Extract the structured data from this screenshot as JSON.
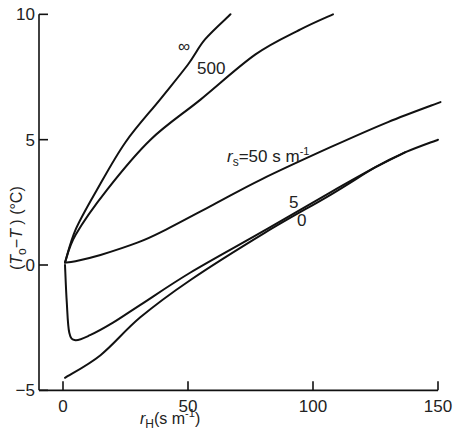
{
  "chart_data": {
    "type": "line",
    "title": "",
    "xlabel": "r_H (s m^-1)",
    "ylabel": "(T_o - T) (°C)",
    "xlim": [
      -9.6,
      150
    ],
    "ylim": [
      -5,
      10
    ],
    "grid": false,
    "x_ticks": [
      0,
      50,
      100,
      150
    ],
    "y_ticks": [
      -5,
      0,
      5,
      10
    ],
    "x_tick_labels": [
      "0",
      "50",
      "100",
      "150"
    ],
    "y_tick_labels": [
      "−5",
      "0",
      "5",
      "10"
    ],
    "series": [
      {
        "name": "∞",
        "label": "∞",
        "points": [
          [
            0.8,
            0.1
          ],
          [
            5,
            1.4
          ],
          [
            13.6,
            3.0
          ],
          [
            25,
            4.9
          ],
          [
            38.8,
            6.6
          ],
          [
            50,
            8.0
          ],
          [
            56.8,
            9.0
          ],
          [
            67,
            10.0
          ]
        ]
      },
      {
        "name": "500",
        "label": "500",
        "points": [
          [
            0.8,
            0.1
          ],
          [
            5,
            1.2
          ],
          [
            17.6,
            3.0
          ],
          [
            35,
            5.0
          ],
          [
            55,
            6.6
          ],
          [
            77,
            8.4
          ],
          [
            95,
            9.4
          ],
          [
            108,
            10.0
          ]
        ]
      },
      {
        "name": "rs=50 s m^-1",
        "label": "r_s=50 s m^-1",
        "points": [
          [
            0.8,
            0.1
          ],
          [
            5,
            0.15
          ],
          [
            15,
            0.4
          ],
          [
            30,
            0.9
          ],
          [
            39,
            1.3
          ],
          [
            60,
            2.4
          ],
          [
            79,
            3.4
          ],
          [
            107,
            4.7
          ],
          [
            130,
            5.7
          ],
          [
            151,
            6.5
          ]
        ]
      },
      {
        "name": "5",
        "label": "5",
        "points": [
          [
            0.8,
            0.0
          ],
          [
            1.5,
            -1.5
          ],
          [
            2.5,
            -2.7
          ],
          [
            5,
            -3.0
          ],
          [
            10.8,
            -2.8
          ],
          [
            20,
            -2.3
          ],
          [
            30.8,
            -1.6
          ],
          [
            51,
            -0.3
          ],
          [
            81,
            1.4
          ],
          [
            107,
            2.9
          ],
          [
            125,
            3.9
          ],
          [
            137,
            4.5
          ]
        ]
      },
      {
        "name": "0",
        "label": "0",
        "points": [
          [
            0.8,
            -4.5
          ],
          [
            15,
            -3.6
          ],
          [
            30.8,
            -2.1
          ],
          [
            51,
            -0.6
          ],
          [
            81,
            1.3
          ],
          [
            107,
            2.8
          ],
          [
            125,
            3.9
          ],
          [
            137,
            4.5
          ],
          [
            150,
            5.0
          ]
        ]
      }
    ],
    "annotations": [
      {
        "text": "∞",
        "near_series": "∞"
      },
      {
        "text": "500",
        "near_series": "500"
      },
      {
        "text": "r_s=50 s m^-1",
        "near_series": "rs=50 s m^-1"
      },
      {
        "text": "5",
        "near_series": "5"
      },
      {
        "text": "0",
        "near_series": "0"
      }
    ]
  }
}
